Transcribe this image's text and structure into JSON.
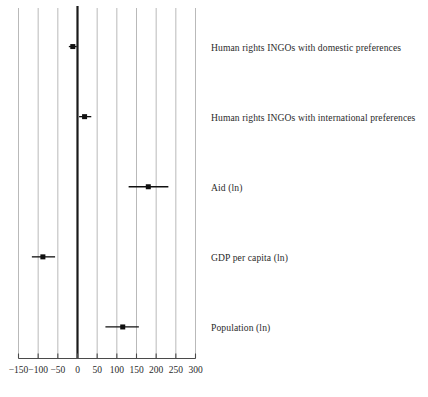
{
  "chart_data": {
    "type": "scatter",
    "subtype": "coefficient-plot-with-error-bars",
    "title": "",
    "subtitle": "",
    "xlabel": "",
    "ylabel": "",
    "xlim": [
      -150,
      300
    ],
    "ylim": [
      0,
      5
    ],
    "grid": true,
    "grid_axis": "x",
    "legend": false,
    "legend_position": "none",
    "zero_reference_line": 0,
    "xticks": [
      -150,
      -100,
      -50,
      0,
      50,
      100,
      150,
      200,
      250,
      300
    ],
    "xticklabels": [
      "−150",
      "−100",
      "−50",
      "0",
      "50",
      "100",
      "150",
      "200",
      "250",
      "300"
    ],
    "categories": [
      "Human rights INGOs with domestic preferences",
      "Human rights INGOs with international preferences",
      "Aid (ln)",
      "GDP per capita (ln)",
      "Population (ln)"
    ],
    "values": [
      -12,
      18,
      180,
      -88,
      115
    ],
    "ci_low": [
      -22,
      4,
      130,
      -116,
      71
    ],
    "ci_high": [
      -2,
      35,
      231,
      -57,
      156
    ],
    "points": [
      {
        "label": "Human rights INGOs with domestic preferences",
        "estimate": -12,
        "ci_low": -22,
        "ci_high": -2
      },
      {
        "label": "Human rights INGOs with international preferences",
        "estimate": 18,
        "ci_low": 4,
        "ci_high": 35
      },
      {
        "label": "Aid (ln)",
        "estimate": 180,
        "ci_low": 130,
        "ci_high": 231
      },
      {
        "label": "GDP per capita (ln)",
        "estimate": -88,
        "ci_low": -116,
        "ci_high": -57
      },
      {
        "label": "Population (ln)",
        "estimate": 115,
        "ci_low": 71,
        "ci_high": 156
      }
    ],
    "colors": {
      "point": "#101010",
      "ci": "#101010",
      "grid": "#b9b9b9",
      "zero_line": "#1a1a1a",
      "axis": "#4a4a4a",
      "text": "#2b2b2b",
      "background": "#ffffff"
    }
  }
}
